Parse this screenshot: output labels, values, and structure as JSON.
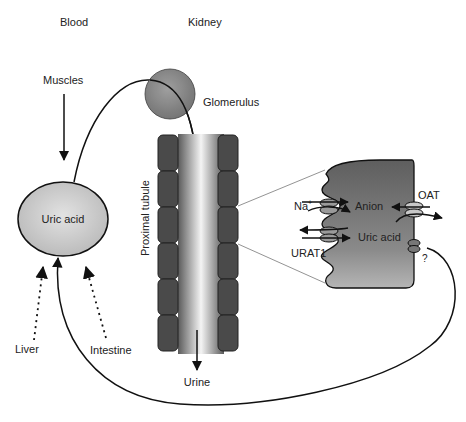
{
  "diagram": {
    "section_labels": {
      "blood": "Blood",
      "kidney": "Kidney"
    },
    "sources": {
      "muscles": "Muscles",
      "liver": "Liver",
      "intestine": "Intestine"
    },
    "pool": {
      "label": "Uric acid"
    },
    "glomerulus": {
      "label": "Glomerulus"
    },
    "tubule": {
      "label": "Proximal tubule",
      "output": "Urine"
    },
    "cell": {
      "sodium": "Na",
      "sodium_sup": "+",
      "anion": "Anion",
      "uric_acid": "Uric acid",
      "urat1": "URAT1",
      "oat": "OAT",
      "unknown": "?"
    },
    "colors": {
      "cell_fill": "#6b6b6b",
      "glomerulus_fill": "#8a8a8a",
      "pool_fill": "#cfcfcf",
      "tubule_block": "#4a4a4a",
      "stroke": "#111111"
    }
  }
}
